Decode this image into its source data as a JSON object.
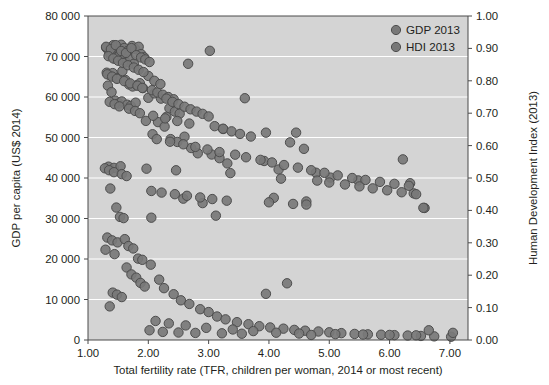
{
  "chart_data": {
    "type": "scatter",
    "title": "",
    "subtitle": "",
    "xlabel": "Total fertility rate (TFR, children per woman, 2014 or most recent)",
    "ylabel": "GDP per capita (US$ 2014)",
    "y2label": "Human Development Index (2013)",
    "xlim": [
      1.0,
      7.3
    ],
    "ylim": [
      0,
      80000
    ],
    "y2lim": [
      0.0,
      1.0
    ],
    "grid": true,
    "grid_axis": "y",
    "legend_position": "top-right",
    "xticks": [
      "1.00",
      "2.00",
      "3.00",
      "4.00",
      "5.00",
      "6.00",
      "7.00"
    ],
    "xtick_values": [
      1,
      2,
      3,
      4,
      5,
      6,
      7
    ],
    "yticks": [
      "0",
      "10 000",
      "20 000",
      "30 000",
      "40 000",
      "50 000",
      "60 000",
      "70 000",
      "80 000"
    ],
    "ytick_values": [
      0,
      10000,
      20000,
      30000,
      40000,
      50000,
      60000,
      70000,
      80000
    ],
    "y2ticks": [
      "0.00",
      "0.10",
      "0.20",
      "0.30",
      "0.40",
      "0.50",
      "0.60",
      "0.70",
      "0.80",
      "0.90",
      "1.00"
    ],
    "y2tick_values": [
      0.0,
      0.1,
      0.2,
      0.3,
      0.4,
      0.5,
      0.6,
      0.7,
      0.8,
      0.9,
      1.0
    ],
    "colors": {
      "plot_background": "#d4d4d4",
      "gridline": "#ffffff",
      "marker_fill": "#787878",
      "marker_stroke": "#4d4d4d",
      "axis": "#4a4a4a",
      "text": "#231f20"
    },
    "series": [
      {
        "name": "GDP 2013",
        "axis": "left",
        "marker": "circle",
        "points": [
          [
            1.3,
            72200
          ],
          [
            1.35,
            71000
          ],
          [
            1.42,
            72800
          ],
          [
            1.46,
            72300
          ],
          [
            1.52,
            71600
          ],
          [
            1.55,
            72900
          ],
          [
            1.6,
            72100
          ],
          [
            1.66,
            71400
          ],
          [
            1.73,
            72600
          ],
          [
            1.78,
            71900
          ],
          [
            1.84,
            72400
          ],
          [
            1.38,
            70200
          ],
          [
            1.44,
            69500
          ],
          [
            1.5,
            69900
          ],
          [
            1.58,
            69100
          ],
          [
            1.63,
            68600
          ],
          [
            1.7,
            69300
          ],
          [
            1.76,
            68200
          ],
          [
            1.88,
            70600
          ],
          [
            1.93,
            69800
          ],
          [
            1.31,
            66000
          ],
          [
            1.36,
            65400
          ],
          [
            1.41,
            65900
          ],
          [
            1.48,
            64700
          ],
          [
            1.57,
            66400
          ],
          [
            1.62,
            64200
          ],
          [
            1.68,
            63100
          ],
          [
            1.74,
            62600
          ],
          [
            1.81,
            62900
          ],
          [
            1.86,
            63400
          ],
          [
            1.91,
            62200
          ],
          [
            2.0,
            65200
          ],
          [
            1.33,
            62800
          ],
          [
            1.39,
            61200
          ],
          [
            1.45,
            59100
          ],
          [
            1.51,
            58400
          ],
          [
            1.56,
            58900
          ],
          [
            1.65,
            58100
          ],
          [
            1.71,
            57800
          ],
          [
            1.79,
            58600
          ],
          [
            1.96,
            54100
          ],
          [
            3.02,
            71400
          ],
          [
            2.66,
            68200
          ],
          [
            2.0,
            59800
          ],
          [
            2.1,
            60900
          ],
          [
            2.21,
            59600
          ],
          [
            2.35,
            57200
          ],
          [
            2.44,
            56400
          ],
          [
            2.52,
            55900
          ],
          [
            2.3,
            55100
          ],
          [
            2.16,
            53800
          ],
          [
            2.27,
            52700
          ],
          [
            2.6,
            50200
          ],
          [
            2.07,
            50800
          ],
          [
            2.37,
            49600
          ],
          [
            2.48,
            48900
          ],
          [
            2.71,
            47400
          ],
          [
            2.82,
            46100
          ],
          [
            3.6,
            59700
          ],
          [
            3.24,
            52100
          ],
          [
            4.45,
            51200
          ],
          [
            3.05,
            45800
          ],
          [
            3.18,
            44900
          ],
          [
            3.31,
            43600
          ],
          [
            3.92,
            44200
          ],
          [
            4.16,
            42100
          ],
          [
            4.78,
            41300
          ],
          [
            5.02,
            40100
          ],
          [
            5.48,
            39400
          ],
          [
            6.22,
            44600
          ],
          [
            6.34,
            38700
          ],
          [
            6.58,
            32600
          ],
          [
            6.4,
            36200
          ],
          [
            1.34,
            42800
          ],
          [
            1.43,
            42500
          ],
          [
            1.54,
            42900
          ],
          [
            1.97,
            42300
          ],
          [
            2.46,
            41900
          ],
          [
            3.36,
            41200
          ],
          [
            1.37,
            37400
          ],
          [
            1.47,
            32700
          ],
          [
            1.53,
            30400
          ],
          [
            1.59,
            30100
          ],
          [
            2.05,
            30200
          ],
          [
            3.12,
            30700
          ],
          [
            2.58,
            34900
          ],
          [
            2.9,
            33800
          ],
          [
            4.08,
            35100
          ],
          [
            4.62,
            34200
          ],
          [
            1.32,
            25300
          ],
          [
            1.4,
            24600
          ],
          [
            1.49,
            24100
          ],
          [
            1.61,
            24900
          ],
          [
            1.67,
            23200
          ],
          [
            1.75,
            22600
          ],
          [
            1.83,
            20100
          ],
          [
            1.9,
            19800
          ],
          [
            1.29,
            22300
          ],
          [
            1.44,
            21200
          ],
          [
            1.64,
            17900
          ],
          [
            1.72,
            16200
          ],
          [
            1.8,
            15400
          ],
          [
            1.87,
            14100
          ],
          [
            1.94,
            13200
          ],
          [
            1.41,
            11700
          ],
          [
            1.48,
            11200
          ],
          [
            1.56,
            10600
          ],
          [
            1.36,
            8300
          ],
          [
            2.04,
            18600
          ],
          [
            2.18,
            14900
          ],
          [
            2.26,
            12800
          ],
          [
            2.42,
            11300
          ],
          [
            2.54,
            9800
          ],
          [
            2.68,
            8900
          ],
          [
            2.86,
            7600
          ],
          [
            3.0,
            6900
          ],
          [
            3.14,
            5800
          ],
          [
            3.28,
            5100
          ],
          [
            3.47,
            4400
          ],
          [
            3.66,
            3900
          ],
          [
            3.84,
            3400
          ],
          [
            4.02,
            3100
          ],
          [
            4.24,
            2800
          ],
          [
            4.42,
            2500
          ],
          [
            4.6,
            2300
          ],
          [
            4.82,
            2100
          ],
          [
            5.0,
            1900
          ],
          [
            5.2,
            1700
          ],
          [
            5.42,
            1500
          ],
          [
            5.64,
            1400
          ],
          [
            5.86,
            1300
          ],
          [
            6.08,
            1200
          ],
          [
            6.3,
            1100
          ],
          [
            6.52,
            1000
          ],
          [
            6.74,
            900
          ],
          [
            7.02,
            800
          ],
          [
            2.12,
            4700
          ],
          [
            2.34,
            4100
          ],
          [
            2.62,
            3600
          ],
          [
            2.96,
            3000
          ],
          [
            3.4,
            2600
          ],
          [
            3.74,
            2200
          ],
          [
            4.12,
            1800
          ],
          [
            4.5,
            1600
          ],
          [
            5.1,
            1450
          ],
          [
            5.56,
            1350
          ],
          [
            6.0,
            1250
          ],
          [
            6.44,
            1150
          ],
          [
            3.95,
            11400
          ],
          [
            4.3,
            14000
          ],
          [
            2.02,
            2400
          ],
          [
            2.24,
            2000
          ],
          [
            2.5,
            1850
          ],
          [
            2.78,
            1750
          ],
          [
            3.22,
            1650
          ],
          [
            3.55,
            1550
          ],
          [
            4.7,
            1250
          ]
        ]
      },
      {
        "name": "HDI 2013",
        "axis": "right",
        "marker": "circle",
        "points": [
          [
            1.3,
            0.905
          ],
          [
            1.38,
            0.898
          ],
          [
            1.46,
            0.91
          ],
          [
            1.55,
            0.892
          ],
          [
            1.63,
            0.886
          ],
          [
            1.72,
            0.901
          ],
          [
            1.8,
            0.879
          ],
          [
            1.88,
            0.872
          ],
          [
            1.95,
            0.866
          ],
          [
            2.02,
            0.858
          ],
          [
            1.34,
            0.876
          ],
          [
            1.42,
            0.869
          ],
          [
            1.5,
            0.862
          ],
          [
            1.58,
            0.855
          ],
          [
            1.66,
            0.848
          ],
          [
            1.76,
            0.841
          ],
          [
            1.84,
            0.834
          ],
          [
            1.92,
            0.827
          ],
          [
            1.32,
            0.82
          ],
          [
            1.4,
            0.813
          ],
          [
            1.48,
            0.806
          ],
          [
            1.6,
            0.799
          ],
          [
            1.7,
            0.792
          ],
          [
            1.82,
            0.785
          ],
          [
            1.9,
            0.778
          ],
          [
            2.06,
            0.771
          ],
          [
            2.15,
            0.764
          ],
          [
            2.24,
            0.757
          ],
          [
            2.33,
            0.75
          ],
          [
            2.42,
            0.743
          ],
          [
            2.1,
            0.8
          ],
          [
            2.2,
            0.79
          ],
          [
            2.3,
            0.745
          ],
          [
            2.4,
            0.735
          ],
          [
            2.5,
            0.728
          ],
          [
            2.6,
            0.72
          ],
          [
            2.7,
            0.712
          ],
          [
            2.8,
            0.705
          ],
          [
            2.9,
            0.698
          ],
          [
            3.0,
            0.69
          ],
          [
            1.36,
            0.735
          ],
          [
            1.44,
            0.728
          ],
          [
            1.52,
            0.721
          ],
          [
            1.68,
            0.714
          ],
          [
            1.78,
            0.707
          ],
          [
            1.86,
            0.7
          ],
          [
            2.08,
            0.692
          ],
          [
            2.28,
            0.684
          ],
          [
            2.48,
            0.676
          ],
          [
            2.68,
            0.668
          ],
          [
            3.1,
            0.66
          ],
          [
            3.24,
            0.652
          ],
          [
            3.38,
            0.644
          ],
          [
            3.52,
            0.636
          ],
          [
            3.7,
            0.628
          ],
          [
            2.14,
            0.62
          ],
          [
            2.36,
            0.612
          ],
          [
            2.58,
            0.604
          ],
          [
            2.78,
            0.596
          ],
          [
            2.98,
            0.588
          ],
          [
            3.18,
            0.58
          ],
          [
            3.44,
            0.572
          ],
          [
            3.62,
            0.564
          ],
          [
            3.86,
            0.556
          ],
          [
            4.05,
            0.548
          ],
          [
            4.25,
            0.54
          ],
          [
            4.48,
            0.532
          ],
          [
            4.7,
            0.524
          ],
          [
            4.92,
            0.516
          ],
          [
            5.14,
            0.508
          ],
          [
            5.38,
            0.5
          ],
          [
            5.6,
            0.494
          ],
          [
            5.84,
            0.488
          ],
          [
            6.08,
            0.482
          ],
          [
            6.32,
            0.476
          ],
          [
            3.95,
            0.64
          ],
          [
            4.35,
            0.61
          ],
          [
            4.58,
            0.59
          ],
          [
            4.2,
            0.498
          ],
          [
            4.8,
            0.492
          ],
          [
            5.0,
            0.486
          ],
          [
            5.26,
            0.48
          ],
          [
            5.5,
            0.474
          ],
          [
            5.72,
            0.468
          ],
          [
            5.96,
            0.462
          ],
          [
            6.2,
            0.456
          ],
          [
            6.44,
            0.45
          ],
          [
            6.56,
            0.408
          ],
          [
            1.28,
            0.53
          ],
          [
            1.35,
            0.524
          ],
          [
            1.43,
            0.518
          ],
          [
            1.56,
            0.512
          ],
          [
            1.64,
            0.506
          ],
          [
            2.05,
            0.46
          ],
          [
            2.22,
            0.455
          ],
          [
            2.44,
            0.45
          ],
          [
            2.64,
            0.445
          ],
          [
            2.86,
            0.44
          ],
          [
            3.06,
            0.435
          ],
          [
            3.3,
            0.43
          ],
          [
            4.0,
            0.425
          ],
          [
            4.4,
            0.42
          ],
          [
            4.62,
            0.418
          ],
          [
            6.65,
            0.03
          ],
          [
            7.05,
            0.022
          ]
        ]
      }
    ],
    "legend": [
      {
        "label": "GDP 2013",
        "marker": "circle",
        "color": "#787878"
      },
      {
        "label": "HDI 2013",
        "marker": "circle",
        "color": "#787878"
      }
    ]
  }
}
